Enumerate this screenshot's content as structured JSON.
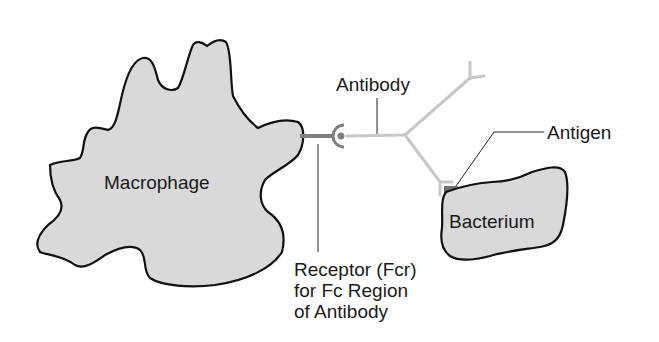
{
  "diagram": {
    "labels": {
      "macrophage": "Macrophage",
      "antibody": "Antibody",
      "antigen": "Antigen",
      "bacterium": "Bacterium",
      "receptor_line1": "Receptor (Fcr)",
      "receptor_line2": "for Fc Region",
      "receptor_line3": "of Antibody"
    },
    "colors": {
      "cell_fill": "#d9d9d9",
      "outline": "#111111",
      "receptor": "#808080",
      "antibody": "#c8c8c8",
      "antigen": "#707070",
      "leader_line": "#222222"
    }
  }
}
